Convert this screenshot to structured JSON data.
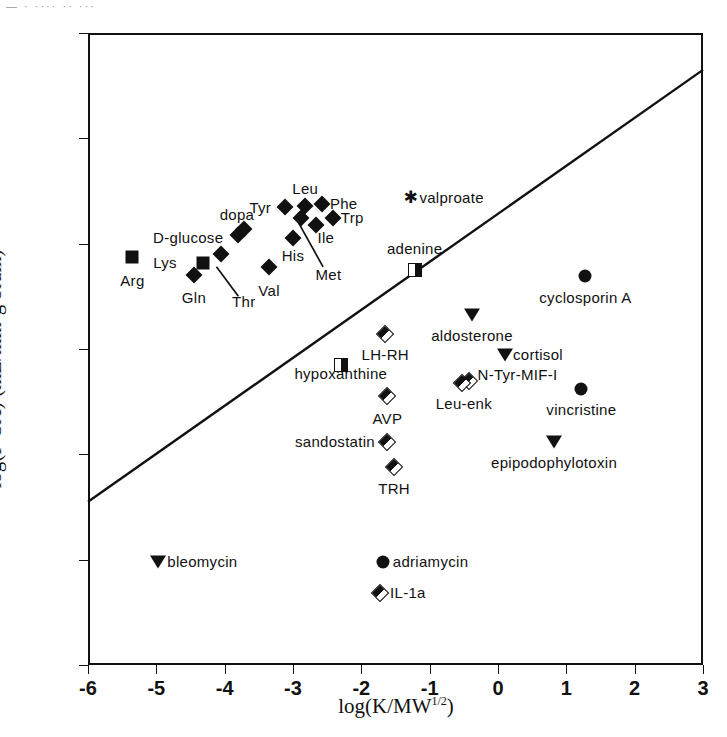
{
  "figure": {
    "top_artifact_text": "— ·  ···· ·· ···",
    "x_axis_title_main": "log(K/MW",
    "x_axis_title_sup": "1/2",
    "x_axis_title_tail": ")",
    "y_axis_title": "log(P·SA)  (mL/min·g brain)"
  },
  "chart_data": {
    "type": "scatter",
    "title": "",
    "xlabel": "log(K/MW^1/2)",
    "ylabel": "log(P·SA) (mL/min·g brain)",
    "xlim": [
      -6,
      3
    ],
    "ylim": [
      -5,
      1
    ],
    "xticks": [
      "-6",
      "-5",
      "-4",
      "-3",
      "-2",
      "-1",
      "0",
      "1",
      "2",
      "3"
    ],
    "xtick_values": [
      -6,
      -5,
      -4,
      -3,
      -2,
      -1,
      0,
      1,
      2,
      3
    ],
    "yticks": [
      "1",
      "0",
      "-1",
      "-2",
      "-3",
      "-4",
      "-5"
    ],
    "ytick_values": [
      1,
      0,
      -1,
      -2,
      -3,
      -4,
      -5
    ],
    "grid": false,
    "legend": "none",
    "regression_line": {
      "label": "regression line",
      "x": [
        -6,
        3
      ],
      "y": [
        -3.45,
        0.65
      ]
    },
    "points": [
      {
        "name": "Arg",
        "x": -5.35,
        "y": -1.13,
        "marker": "square",
        "label": "Arg",
        "lx": -5.35,
        "ly": -1.35,
        "align": "center"
      },
      {
        "name": "Lys",
        "x": -4.32,
        "y": -1.18,
        "marker": "square",
        "label": "Lys",
        "lx": -4.7,
        "ly": -1.18,
        "align": "right"
      },
      {
        "name": "Gln",
        "x": -4.45,
        "y": -1.3,
        "marker": "diamond",
        "label": "Gln",
        "lx": -4.45,
        "ly": -1.52,
        "align": "center"
      },
      {
        "name": "Thr",
        "x": -4.05,
        "y": -1.1,
        "marker": "diamond",
        "label": "Thr",
        "lx": -3.72,
        "ly": -1.55,
        "align": "center"
      },
      {
        "name": "D-glucose",
        "x": -3.8,
        "y": -0.92,
        "marker": "diamond",
        "label": "D-glucose",
        "lx": -4.02,
        "ly": -0.95,
        "align": "right"
      },
      {
        "name": "dopa",
        "x": -3.72,
        "y": -0.86,
        "marker": "diamond",
        "label": "dopa",
        "lx": -3.82,
        "ly": -0.73,
        "align": "center"
      },
      {
        "name": "Val",
        "x": -3.35,
        "y": -1.22,
        "marker": "diamond",
        "label": "Val",
        "lx": -3.35,
        "ly": -1.45,
        "align": "center"
      },
      {
        "name": "Tyr",
        "x": -3.12,
        "y": -0.65,
        "marker": "diamond",
        "label": "Tyr",
        "lx": -3.32,
        "ly": -0.66,
        "align": "right"
      },
      {
        "name": "His",
        "x": -3.0,
        "y": -0.95,
        "marker": "diamond",
        "label": "His",
        "lx": -3.0,
        "ly": -1.12,
        "align": "center"
      },
      {
        "name": "Leu",
        "x": -2.82,
        "y": -0.64,
        "marker": "diamond",
        "label": "Leu",
        "lx": -2.82,
        "ly": -0.48,
        "align": "center"
      },
      {
        "name": "Met",
        "x": -2.88,
        "y": -0.76,
        "marker": "diamond",
        "label": "Met",
        "lx": -2.48,
        "ly": -1.3,
        "align": "center"
      },
      {
        "name": "Ile",
        "x": -2.66,
        "y": -0.82,
        "marker": "diamond",
        "label": "Ile",
        "lx": -2.52,
        "ly": -0.95,
        "align": "center"
      },
      {
        "name": "Phe",
        "x": -2.58,
        "y": -0.62,
        "marker": "diamond",
        "label": "Phe",
        "lx": -2.46,
        "ly": -0.62,
        "align": "left"
      },
      {
        "name": "Trp",
        "x": -2.42,
        "y": -0.76,
        "marker": "diamond",
        "label": "Trp",
        "lx": -2.3,
        "ly": -0.76,
        "align": "left"
      },
      {
        "name": "valproate",
        "x": -1.28,
        "y": -0.57,
        "marker": "star",
        "label": "valproate",
        "lx": -1.15,
        "ly": -0.57,
        "align": "left"
      },
      {
        "name": "adenine",
        "x": -1.22,
        "y": -1.25,
        "marker": "halfsquare",
        "label": "adenine",
        "lx": -1.22,
        "ly": -1.05,
        "align": "center"
      },
      {
        "name": "cyclosporin A",
        "x": 1.28,
        "y": -1.31,
        "marker": "circle",
        "label": "cyclosporin A",
        "lx": 1.28,
        "ly": -1.52,
        "align": "center"
      },
      {
        "name": "aldosterone",
        "x": -0.38,
        "y": -1.68,
        "marker": "tri-down",
        "label": "aldosterone",
        "lx": -0.38,
        "ly": -1.88,
        "align": "center"
      },
      {
        "name": "LH-RH",
        "x": -1.65,
        "y": -1.86,
        "marker": "halfdiamond",
        "label": "LH-RH",
        "lx": -1.65,
        "ly": -2.06,
        "align": "center"
      },
      {
        "name": "hypoxanthine",
        "x": -2.3,
        "y": -2.02,
        "marker": "halfsquare",
        "label": "hypoxanthine",
        "lx": -2.3,
        "ly": -2.24,
        "align": "center"
      },
      {
        "name": "cortisol",
        "x": 0.1,
        "y": -2.06,
        "marker": "tri-down",
        "label": "cortisol",
        "lx": 0.22,
        "ly": -2.06,
        "align": "left"
      },
      {
        "name": "N-Tyr-MIF-I",
        "x": -0.42,
        "y": -2.3,
        "marker": "halfdiamond",
        "label": "N-Tyr-MIF-I",
        "lx": -0.3,
        "ly": -2.25,
        "align": "left"
      },
      {
        "name": "Leu-enk",
        "x": -0.52,
        "y": -2.32,
        "marker": "halfdiamond",
        "label": "Leu-enk",
        "lx": -0.5,
        "ly": -2.52,
        "align": "center"
      },
      {
        "name": "vincristine",
        "x": 1.22,
        "y": -2.38,
        "marker": "circle",
        "label": "vincristine",
        "lx": 1.22,
        "ly": -2.58,
        "align": "center"
      },
      {
        "name": "AVP",
        "x": -1.62,
        "y": -2.45,
        "marker": "halfdiamond",
        "label": "AVP",
        "lx": -1.62,
        "ly": -2.66,
        "align": "center"
      },
      {
        "name": "sandostatin",
        "x": -1.62,
        "y": -2.88,
        "marker": "halfdiamond",
        "label": "sandostatin",
        "lx": -1.8,
        "ly": -2.88,
        "align": "right"
      },
      {
        "name": "epipodophylotoxin",
        "x": 0.82,
        "y": -2.88,
        "marker": "tri-down",
        "label": "epipodophylotoxin",
        "lx": 0.82,
        "ly": -3.08,
        "align": "center"
      },
      {
        "name": "TRH",
        "x": -1.52,
        "y": -3.12,
        "marker": "halfdiamond",
        "label": "TRH",
        "lx": -1.52,
        "ly": -3.33,
        "align": "center"
      },
      {
        "name": "bleomycin",
        "x": -4.98,
        "y": -4.02,
        "marker": "tri-down",
        "label": "bleomycin",
        "lx": -4.84,
        "ly": -4.02,
        "align": "left"
      },
      {
        "name": "adriamycin",
        "x": -1.68,
        "y": -4.02,
        "marker": "circle",
        "label": "adriamycin",
        "lx": -1.54,
        "ly": -4.02,
        "align": "left"
      },
      {
        "name": "IL-1a",
        "x": -1.72,
        "y": -4.32,
        "marker": "halfdiamond",
        "label": "IL-1a",
        "lx": -1.58,
        "ly": -4.32,
        "align": "left"
      }
    ],
    "leader_lines": [
      {
        "from_name": "Thr",
        "x1": -4.12,
        "y1": -1.22,
        "x2": -3.8,
        "y2": -1.5
      },
      {
        "from_name": "Met",
        "x1": -2.92,
        "y1": -0.8,
        "x2": -2.56,
        "y2": -1.22
      }
    ]
  }
}
